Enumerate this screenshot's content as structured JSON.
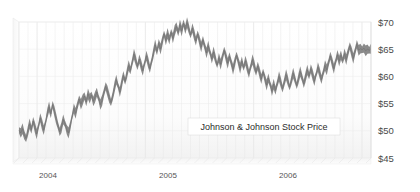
{
  "chart_data": {
    "type": "line",
    "title": "Johnson & Johnson Stock Price",
    "xlabel": "",
    "ylabel": "",
    "ylim": [
      45,
      70
    ],
    "y_ticks": [
      45,
      50,
      55,
      60,
      65,
      70
    ],
    "y_tick_labels": [
      "$45",
      "$50",
      "$55",
      "$60",
      "$65",
      "$70"
    ],
    "y_axis_position": "right",
    "x_ticks": [
      "2004",
      "2005",
      "2006"
    ],
    "x_tick_labels": [
      "2004",
      "2005",
      "2006"
    ],
    "xlim_start": "2003-10",
    "xlim_end": "2006-12",
    "grid": "vertical-monthly-and-horizontal-major",
    "legend": "inline-label-box",
    "series": [
      {
        "name": "Johnson & Johnson Stock Price",
        "color": "#808080",
        "style": "high-low-band",
        "values": [
          50.1,
          49.6,
          50.4,
          49.2,
          48.6,
          49.9,
          51.3,
          50.2,
          51.8,
          50.6,
          49.4,
          50.8,
          52.4,
          51.2,
          50.1,
          51.5,
          53.2,
          54.4,
          53.1,
          54.8,
          53.6,
          52.2,
          51.0,
          49.8,
          50.6,
          52.1,
          51.3,
          50.2,
          49.6,
          50.9,
          52.6,
          54.1,
          53.2,
          54.6,
          55.8,
          54.9,
          55.7,
          56.4,
          55.3,
          56.8,
          55.9,
          56.6,
          55.4,
          56.2,
          57.1,
          56.0,
          54.8,
          55.6,
          57.0,
          58.2,
          57.3,
          56.1,
          55.2,
          56.4,
          58.0,
          59.4,
          58.3,
          57.1,
          58.6,
          60.2,
          59.1,
          60.5,
          62.0,
          61.1,
          62.6,
          64.1,
          63.0,
          61.8,
          63.2,
          62.1,
          61.0,
          62.4,
          63.8,
          62.6,
          61.4,
          62.8,
          64.3,
          65.8,
          64.6,
          66.1,
          65.0,
          66.4,
          67.8,
          66.6,
          67.9,
          66.7,
          68.1,
          67.0,
          68.4,
          69.2,
          68.1,
          69.5,
          68.3,
          69.8,
          68.6,
          69.9,
          68.8,
          67.6,
          68.9,
          67.7,
          66.5,
          67.8,
          66.6,
          65.4,
          66.7,
          65.5,
          64.3,
          65.6,
          64.4,
          63.2,
          64.5,
          63.3,
          62.1,
          63.4,
          62.2,
          63.5,
          64.8,
          63.6,
          62.4,
          63.7,
          62.5,
          61.3,
          62.6,
          63.9,
          62.7,
          61.5,
          62.8,
          61.6,
          62.9,
          61.7,
          60.5,
          61.8,
          63.1,
          62.0,
          60.8,
          61.9,
          60.7,
          59.5,
          60.8,
          59.6,
          58.4,
          59.7,
          58.5,
          57.3,
          58.6,
          57.4,
          58.7,
          60.0,
          58.9,
          57.7,
          59.0,
          60.3,
          59.2,
          58.0,
          59.3,
          60.6,
          59.5,
          58.3,
          59.6,
          60.9,
          59.8,
          58.6,
          59.9,
          61.2,
          60.1,
          61.4,
          60.3,
          59.1,
          60.4,
          61.7,
          60.6,
          59.4,
          60.7,
          62.0,
          61.2,
          62.5,
          63.8,
          62.6,
          61.4,
          62.7,
          64.0,
          62.8,
          63.9,
          62.9,
          64.2,
          63.1,
          64.4,
          65.6,
          64.5,
          63.3,
          64.6,
          65.9,
          64.8,
          65.1,
          64.9,
          65.2,
          64.7,
          65.0,
          64.8,
          65.1
        ]
      }
    ]
  },
  "series_label": {
    "text": "Johnson & Johnson Stock Price"
  },
  "colors": {
    "line": "#808080",
    "line_dark": "#6e6e6e",
    "plot_background": "#fbfbfb",
    "gridline": "#e8e8e8",
    "axis_text": "#4a4a4a",
    "floor": "#efefef"
  }
}
